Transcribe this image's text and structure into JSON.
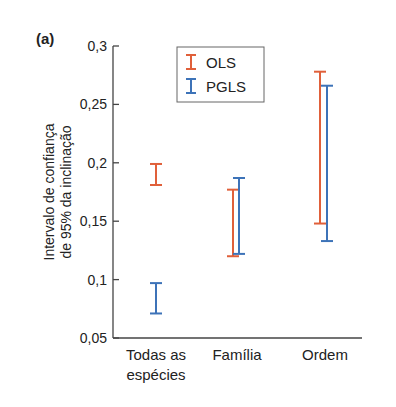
{
  "chart_data": {
    "type": "errorbar",
    "panel_label": "(a)",
    "title": "",
    "xlabel": "",
    "ylabel": "Intervalo de confiança de 95% da inclinação",
    "ylabel_lines": [
      "Intervalo de confiança",
      "de 95% da inclinação"
    ],
    "ylim": [
      0.05,
      0.3
    ],
    "yticks": [
      0.05,
      0.1,
      0.15,
      0.2,
      0.25,
      0.3
    ],
    "ytick_labels": [
      "0,05",
      "0,1",
      "0,15",
      "0,2",
      "0,25",
      "0,3"
    ],
    "categories": [
      "Todas as espécies",
      "Família",
      "Ordem"
    ],
    "category_lines": [
      [
        "Todas as",
        "espécies"
      ],
      [
        "Família"
      ],
      [
        "Ordem"
      ]
    ],
    "grid": false,
    "legend_position": "upper center",
    "series": [
      {
        "name": "OLS",
        "color": "#e0603a",
        "low": [
          0.181,
          0.12,
          0.148
        ],
        "high": [
          0.199,
          0.177,
          0.278
        ]
      },
      {
        "name": "PGLS",
        "color": "#3d73b8",
        "low": [
          0.071,
          0.122,
          0.133
        ],
        "high": [
          0.097,
          0.187,
          0.266
        ]
      }
    ]
  }
}
